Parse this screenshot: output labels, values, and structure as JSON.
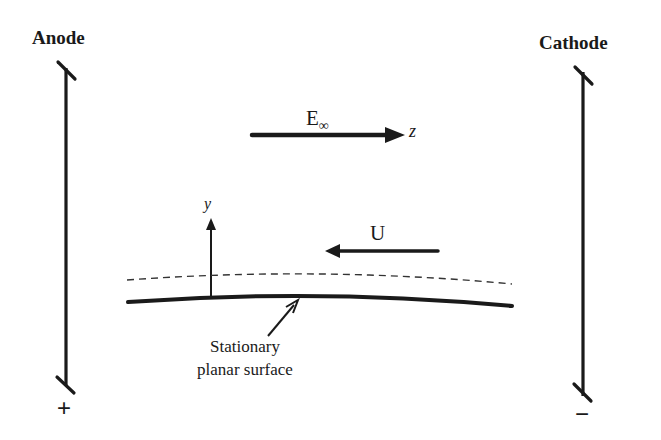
{
  "diagram": {
    "anode": {
      "label": "Anode",
      "polarity": "+"
    },
    "cathode": {
      "label": "Cathode",
      "polarity": "−"
    },
    "field": {
      "label": "E",
      "subscript": "∞",
      "axis": "z"
    },
    "wall_axis": {
      "label": "y"
    },
    "velocity": {
      "label": "U"
    },
    "surface": {
      "caption_line1": "Stationary",
      "caption_line2": "planar surface"
    },
    "colors": {
      "ink": "#1a1a1a",
      "background": "#ffffff",
      "dashed": "#333333"
    }
  }
}
